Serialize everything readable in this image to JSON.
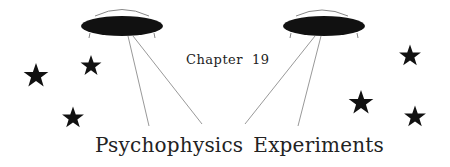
{
  "chapter": {
    "label": "Chapter",
    "number": "19"
  },
  "title": {
    "word1": "Psychophysics",
    "word2": "Experiments"
  },
  "decorations": {
    "icons": [
      "ufo-icon-left",
      "ufo-icon-right",
      "star-icon"
    ],
    "star_count": 6,
    "ufo_count": 2,
    "colors": {
      "ink": "#111111",
      "beam": "#999999",
      "dome": "#888888",
      "background": "#ffffff"
    }
  }
}
